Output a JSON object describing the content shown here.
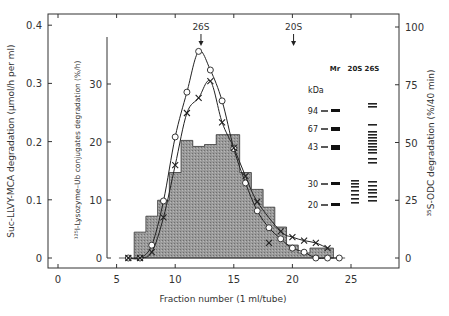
{
  "chart_data": {
    "type": "bar+line",
    "title": "",
    "xlabel": "Fraction  number (1 ml/tube)",
    "xlim": [
      -0.8,
      29.2
    ],
    "x_ticks": [
      0,
      5,
      10,
      15,
      20,
      25
    ],
    "axes": {
      "left_outer": {
        "label": "Suc-LLVY-MCA degradation (µmol/h per ml)",
        "ticks": [
          0,
          0.1,
          0.2,
          0.3,
          0.4
        ],
        "tick_labels": [
          "0",
          "0.1",
          "0.2",
          "0.3",
          "0.4"
        ],
        "ylim": [
          0,
          0.4
        ]
      },
      "left_inner": {
        "label": "¹²⁵I-Lysozyme–Ub conjugates degradation (%/h)",
        "ticks": [
          0,
          10,
          20,
          30
        ],
        "tick_labels": [
          "0",
          "10",
          "20",
          "30"
        ],
        "ylim": [
          0,
          38
        ]
      },
      "right": {
        "label": "³⁵S-ODC degradation (%/40 min)",
        "ticks": [
          0,
          25,
          50,
          75,
          100
        ],
        "tick_labels": [
          "0",
          "25",
          "50",
          "75",
          "100"
        ],
        "ylim": [
          0,
          100
        ]
      }
    },
    "series": [
      {
        "name": "Suc-LLVY-MCA degradation (open circles)",
        "axis": "left_outer",
        "marker": "circle",
        "x": [
          6,
          7,
          8,
          9,
          10,
          11,
          12,
          13,
          14,
          15,
          16,
          17,
          18,
          19,
          20,
          21,
          22,
          23,
          24
        ],
        "values": [
          0,
          0,
          0.022,
          0.098,
          0.208,
          0.285,
          0.355,
          0.323,
          0.27,
          0.188,
          0.129,
          0.081,
          0.052,
          0.033,
          0.017,
          0.01,
          0,
          0,
          0
        ]
      },
      {
        "name": "125I-Lysozyme-Ub conjugates degradation (crosses)",
        "axis": "left_inner",
        "marker": "cross",
        "x": [
          6,
          7,
          8,
          9,
          10,
          11,
          12,
          13,
          14,
          15,
          16,
          17,
          18,
          19,
          20,
          21,
          22,
          23
        ],
        "values": [
          0,
          0,
          1,
          7,
          16,
          25,
          27.6,
          30.5,
          23.4,
          19,
          14.1,
          9.7,
          2.6,
          4.6,
          3.6,
          3,
          2.6,
          1.7
        ]
      },
      {
        "name": "35S-ODC degradation (shaded histogram)",
        "axis": "right",
        "marker": "bar",
        "x": [
          7,
          8,
          9,
          10,
          11,
          12,
          13,
          14,
          15,
          16,
          17,
          18,
          19,
          20,
          21,
          22,
          23
        ],
        "values": [
          11.2,
          18.1,
          25,
          37,
          50.9,
          48.3,
          49.1,
          53.4,
          53.4,
          37,
          29.7,
          22,
          13.4,
          5.6,
          2.2,
          4.3,
          4.3
        ]
      }
    ],
    "annotations": [
      {
        "text": "26S",
        "x": 12.2,
        "arrow": "down"
      },
      {
        "text": "20S",
        "x": 20.1,
        "arrow": "down"
      }
    ],
    "inset_gel": {
      "header": {
        "mr": "Mr",
        "lane1": "20S",
        "lane2": "26S"
      },
      "unit": "kDa",
      "markers": [
        "94",
        "67",
        "43",
        "30",
        "20"
      ]
    },
    "grid": false,
    "legend": "none"
  }
}
